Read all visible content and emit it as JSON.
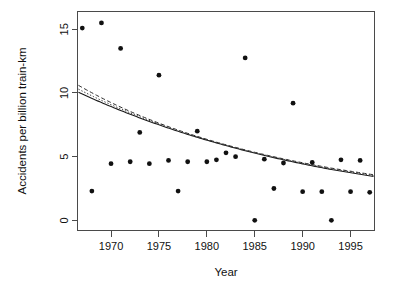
{
  "chart_data": {
    "type": "scatter",
    "title": "",
    "xlabel": "Year",
    "ylabel": "Accidents per billion train-km",
    "xlim": [
      1966.5,
      1997.5
    ],
    "ylim": [
      -0.8,
      16.4
    ],
    "xticks": [
      1970,
      1975,
      1980,
      1985,
      1990,
      1995
    ],
    "xtick_labels": [
      "1970",
      "1975",
      "1980",
      "1985",
      "1990",
      "1995"
    ],
    "yticks": [
      0,
      5,
      10,
      15
    ],
    "ytick_labels": [
      "0",
      "5",
      "10",
      "15"
    ],
    "grid": false,
    "legend": "none",
    "box": true,
    "points": [
      {
        "x": 1967,
        "y": 15.1
      },
      {
        "x": 1968,
        "y": 2.3
      },
      {
        "x": 1969,
        "y": 15.5
      },
      {
        "x": 1970,
        "y": 4.45
      },
      {
        "x": 1971,
        "y": 13.5
      },
      {
        "x": 1972,
        "y": 4.6
      },
      {
        "x": 1973,
        "y": 6.9
      },
      {
        "x": 1974,
        "y": 4.45
      },
      {
        "x": 1975,
        "y": 11.4
      },
      {
        "x": 1976,
        "y": 4.7
      },
      {
        "x": 1977,
        "y": 2.3
      },
      {
        "x": 1978,
        "y": 4.6
      },
      {
        "x": 1979,
        "y": 7.0
      },
      {
        "x": 1980,
        "y": 4.6
      },
      {
        "x": 1981,
        "y": 4.75
      },
      {
        "x": 1982,
        "y": 5.3
      },
      {
        "x": 1983,
        "y": 5.0
      },
      {
        "x": 1984,
        "y": 12.75
      },
      {
        "x": 1985,
        "y": 0.0
      },
      {
        "x": 1986,
        "y": 4.8
      },
      {
        "x": 1987,
        "y": 2.5
      },
      {
        "x": 1988,
        "y": 4.5
      },
      {
        "x": 1989,
        "y": 9.2
      },
      {
        "x": 1990,
        "y": 2.25
      },
      {
        "x": 1991,
        "y": 4.55
      },
      {
        "x": 1992,
        "y": 2.25
      },
      {
        "x": 1993,
        "y": 0.0
      },
      {
        "x": 1994,
        "y": 4.75
      },
      {
        "x": 1995,
        "y": 2.25
      },
      {
        "x": 1996,
        "y": 4.7
      },
      {
        "x": 1997,
        "y": 2.2
      }
    ],
    "series": [
      {
        "name": "fitted-curve-solid",
        "style": "solid",
        "x": [
          1966.6,
          1969,
          1972,
          1975,
          1978,
          1981,
          1984,
          1987,
          1990,
          1993,
          1997.4
        ],
        "y": [
          10.05,
          9.25,
          8.33,
          7.5,
          6.75,
          6.08,
          5.47,
          4.92,
          4.43,
          3.99,
          3.45
        ]
      },
      {
        "name": "fitted-curve-dashed",
        "style": "dashed",
        "x": [
          1966.6,
          1969,
          1972,
          1975,
          1978,
          1981,
          1984,
          1987,
          1990,
          1993,
          1997.4
        ],
        "y": [
          10.6,
          9.62,
          8.55,
          7.63,
          6.83,
          6.14,
          5.53,
          4.99,
          4.52,
          4.1,
          3.58
        ]
      },
      {
        "name": "fitted-curve-dotted",
        "style": "dotted",
        "x": [
          1966.6,
          1969,
          1972,
          1975,
          1978,
          1981,
          1984,
          1987,
          1990,
          1993,
          1997.4
        ],
        "y": [
          10.3,
          9.42,
          8.44,
          7.56,
          6.79,
          6.11,
          5.5,
          4.96,
          4.48,
          4.05,
          3.52
        ]
      }
    ]
  }
}
